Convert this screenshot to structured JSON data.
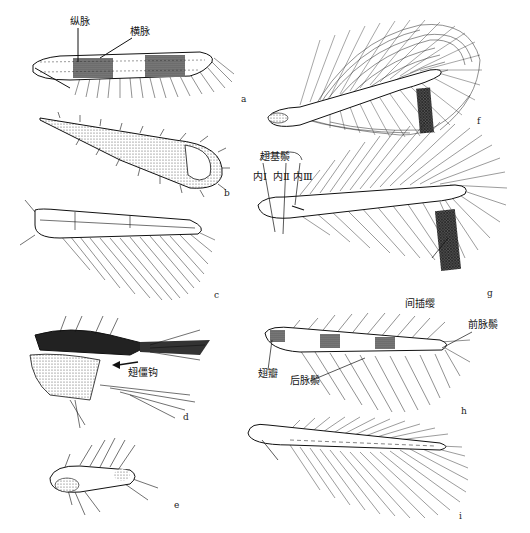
{
  "figure": {
    "panels": [
      {
        "id": "a",
        "letter": "a",
        "labels": [
          "纵脉",
          "横脉"
        ]
      },
      {
        "id": "b",
        "letter": "b",
        "labels": []
      },
      {
        "id": "c",
        "letter": "c",
        "labels": []
      },
      {
        "id": "d",
        "letter": "d",
        "labels": [
          "翅僵钩"
        ]
      },
      {
        "id": "e",
        "letter": "e",
        "labels": []
      },
      {
        "id": "f",
        "letter": "f",
        "labels": []
      },
      {
        "id": "g",
        "letter": "g",
        "labels": [
          "翅基鬃",
          "内Ⅰ",
          "内Ⅱ",
          "内Ⅲ",
          "间插缨"
        ]
      },
      {
        "id": "h",
        "letter": "h",
        "labels": [
          "前脉鬃",
          "翅瓣",
          "后脉鬃"
        ]
      },
      {
        "id": "i",
        "letter": "i",
        "labels": []
      }
    ]
  },
  "labels": {
    "a_longitudinal_vein": "纵脉",
    "a_cross_vein": "横脉",
    "d_wing_hook": "翅僵钩",
    "g_basal_setae": "翅基鬃",
    "g_inner1": "内Ⅰ",
    "g_inner2": "内Ⅱ",
    "g_inner3": "内Ⅲ",
    "g_interfringe": "间插缨",
    "h_fore_vein_setae": "前脉鬃",
    "h_wing_lobe": "翅瓣",
    "h_hind_vein_setae": "后脉鬃"
  },
  "panel_letters": {
    "a": "a",
    "b": "b",
    "c": "c",
    "d": "d",
    "e": "e",
    "f": "f",
    "g": "g",
    "h": "h",
    "i": "i"
  }
}
